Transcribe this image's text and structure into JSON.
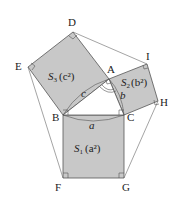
{
  "colors": {
    "fill": "#c8c8c8",
    "stroke": "#555555",
    "background": "#ffffff"
  },
  "points": {
    "A": [
      109,
      79
    ],
    "B": [
      63,
      115
    ],
    "C": [
      124,
      115
    ],
    "D": [
      73,
      32
    ],
    "E": [
      28,
      67
    ],
    "F": [
      63,
      178
    ],
    "G": [
      124,
      178
    ],
    "H": [
      158,
      101
    ],
    "I": [
      147,
      64
    ]
  },
  "labels": {
    "A": "A",
    "B": "B",
    "C": "C",
    "D": "D",
    "E": "E",
    "F": "F",
    "G": "G",
    "H": "H",
    "I": "I",
    "side_a": "a",
    "side_b": "b",
    "side_c": "c",
    "S1_main": "S",
    "S1_sub": "1",
    "S1_area": "(a²)",
    "S2_main": "S",
    "S2_sub": "2",
    "S2_area": "(b²)",
    "S3_main": "S",
    "S3_sub": "3",
    "S3_area": "(c²)"
  }
}
